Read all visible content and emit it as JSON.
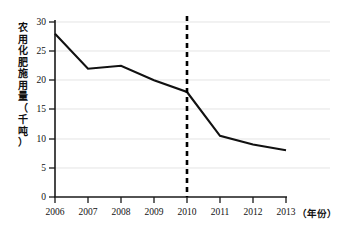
{
  "chart_data": {
    "type": "line",
    "title": "",
    "xlabel": "（年份）",
    "ylabel": "农用化肥施用量（千吨）",
    "categories": [
      "2006",
      "2007",
      "2008",
      "2009",
      "2010",
      "2011",
      "2012",
      "2013"
    ],
    "values": [
      28,
      22,
      22.5,
      20,
      18,
      10.5,
      9,
      8
    ],
    "series": [
      {
        "name": "农用化肥施用量",
        "values": [
          28,
          22,
          22.5,
          20,
          18,
          10.5,
          9,
          8
        ]
      }
    ],
    "ylim": [
      0,
      30
    ],
    "ytick_labels": [
      "0",
      "5",
      "10",
      "15",
      "20",
      "25",
      "30"
    ],
    "ytick_values": [
      0,
      5,
      10,
      15,
      20,
      25,
      30
    ],
    "xtick_labels": [
      "2006",
      "2007",
      "2008",
      "2009",
      "2010",
      "2011",
      "2012",
      "2013"
    ],
    "grid": true,
    "legend": "none",
    "annotations": [
      {
        "name": "vertical-dashed-marker",
        "x": "2010",
        "style": "dashed",
        "color": "#000000"
      }
    ],
    "line_color": "#111111"
  },
  "y_axis": {
    "title_chars": [
      "农",
      "用",
      "化",
      "肥",
      "施",
      "用",
      "量",
      "（",
      "千",
      "吨",
      "）"
    ],
    "label_30": "30",
    "label_25": "25",
    "label_20": "20",
    "label_15": "15",
    "label_10": "10",
    "label_5": "5",
    "label_0": "0"
  },
  "x_axis": {
    "label_2006": "2006",
    "label_2007": "2007",
    "label_2008": "2008",
    "label_2009": "2009",
    "label_2010": "2010",
    "label_2011": "2011",
    "label_2012": "2012",
    "label_2013": "2013",
    "unit_label": "（年份）"
  }
}
